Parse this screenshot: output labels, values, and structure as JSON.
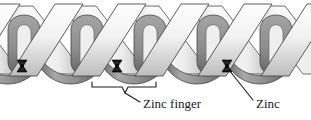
{
  "figure": {
    "width": 311,
    "height": 120,
    "background_color": "#ffffff"
  },
  "labels": {
    "zinc_finger": "Zinc finger",
    "zinc": "Zinc"
  },
  "colors": {
    "helix_light": "#e8e8e8",
    "helix_light_shade": "#c0c0c0",
    "loop_dark": "#8a8a8a",
    "loop_dark_shade": "#6a6a6a",
    "zinc_node": "#1c1c1c",
    "outline": "#3a3a3a",
    "text": "#1a1a1a",
    "leader": "#1a1a1a"
  },
  "structure": {
    "repeat_period_px": 63,
    "zinc_node_positions_x": [
      22,
      117,
      227
    ],
    "zinc_node_y": 66,
    "helix_band_top_y": 4,
    "loop_baseline_y": 78
  },
  "annotations": {
    "bracket": {
      "left_x": 92,
      "right_x": 156,
      "top_y": 82,
      "notch_x": 124,
      "notch_y": 92
    },
    "zinc_leader": {
      "from_x": 229,
      "from_y": 70,
      "to_x": 252,
      "to_y": 99
    }
  }
}
